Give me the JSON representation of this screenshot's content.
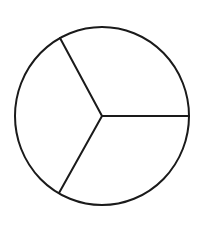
{
  "diagram": {
    "type": "circle-divided-into-sectors",
    "sector_count": 3,
    "fraction_each": "1/3",
    "stroke_color": "#1a1a1a",
    "background_color": "#ffffff",
    "shape": {
      "center": [
        102,
        116
      ],
      "radius_x": 87,
      "radius_y": 89
    },
    "spokes": [
      {
        "name": "upper-left",
        "end": [
          60,
          38
        ]
      },
      {
        "name": "right",
        "end": [
          189,
          116
        ]
      },
      {
        "name": "lower-left",
        "end": [
          59,
          193
        ]
      }
    ]
  }
}
